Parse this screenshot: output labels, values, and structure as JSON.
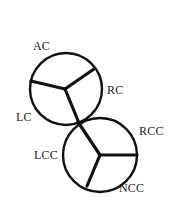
{
  "figure": {
    "width": 174,
    "height": 220,
    "background_color": "#ffffff",
    "stroke_color": "#111111"
  },
  "shapes": {
    "circles": [
      {
        "name": "upper-circle",
        "cx": 66,
        "cy": 89,
        "r": 36,
        "stroke_width": 2.4
      },
      {
        "name": "lower-circle",
        "cx": 100,
        "cy": 155,
        "r": 37,
        "stroke_width": 2.4
      }
    ],
    "junctions": [
      {
        "name": "upper-junction",
        "center_x": 65,
        "center_y": 89,
        "stroke_width": 3.2,
        "branches": [
          {
            "name": "upper-branch-to-ac-rc",
            "x": 94,
            "y": 69
          },
          {
            "name": "upper-branch-to-lc",
            "x": 31,
            "y": 81
          },
          {
            "name": "upper-branch-to-tangent",
            "x": 79,
            "y": 123
          }
        ]
      },
      {
        "name": "lower-junction",
        "center_x": 100,
        "center_y": 155,
        "stroke_width": 3.2,
        "branches": [
          {
            "name": "lower-branch-to-tangent",
            "x": 78,
            "y": 122
          },
          {
            "name": "lower-branch-to-rcc",
            "x": 137,
            "y": 155
          },
          {
            "name": "lower-branch-to-ncc",
            "x": 87,
            "y": 186
          }
        ]
      }
    ],
    "tangent_point": {
      "name": "circle-tangent-point",
      "x": 78,
      "y": 122
    }
  },
  "labels": {
    "ac": "AC",
    "rc": "RC",
    "lc": "LC",
    "rcc": "RCC",
    "lcc": "LCC",
    "ncc": "NCC"
  }
}
